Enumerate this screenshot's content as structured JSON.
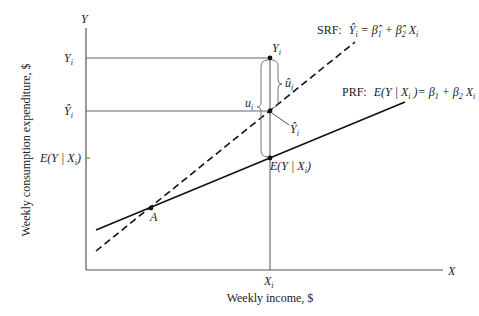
{
  "diagram": {
    "type": "regression-diagram",
    "axes": {
      "y_label": "Y",
      "x_label": "X",
      "y_title": "Weekly consumption expenditure, $",
      "x_title": "Weekly income, $"
    },
    "y_ticks": {
      "yi": "Y",
      "yi_sub": "i",
      "yhat": "Ŷ",
      "yhat_sub": "i",
      "eyx": "E(Y | X",
      "eyx_sub": "i",
      "eyx_close": ")"
    },
    "x_ticks": {
      "xi": "X",
      "xi_sub": "i"
    },
    "srf": {
      "prefix": "SRF:",
      "eq_lhs": "Ŷ",
      "eq_lhs_sub": "i",
      "eq_rhs_1": "= β̂",
      "eq_rhs_1_sub": "1",
      "eq_plus": "+ β̂",
      "eq_rhs_2_sub": "2",
      "eq_x": "X",
      "eq_x_sub": "i",
      "style": "dashed"
    },
    "prf": {
      "prefix": "PRF:",
      "eq_lhs": "E(Y | X",
      "eq_lhs_sub": "i",
      "eq_mid": ")= β",
      "eq_b1_sub": "1",
      "eq_plus": "+ β",
      "eq_b2_sub": "2",
      "eq_x": "X",
      "eq_x_sub": "i",
      "style": "solid"
    },
    "annotations": {
      "point_yi": "Y",
      "point_yi_sub": "i",
      "uhat": "û",
      "uhat_sub": "i",
      "u": "u",
      "u_sub": "i",
      "yhat_pointer": "Ŷ",
      "yhat_pointer_sub": "i",
      "eyx_point": "E(Y | X",
      "eyx_point_sub": "i",
      "eyx_point_close": ")",
      "intersection": "A"
    },
    "colors": {
      "line": "#111111",
      "axis": "#555555",
      "bracket": "#777777"
    }
  }
}
